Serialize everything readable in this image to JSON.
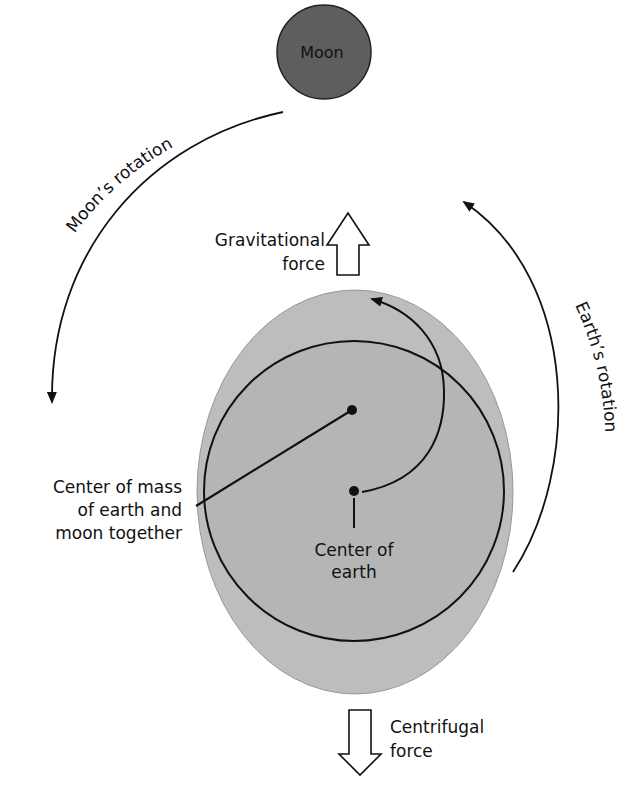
{
  "diagram": {
    "moon": {
      "label": "Moon",
      "fill": "#5e5e5e"
    },
    "earth": {
      "outer_fill": "#bdbdbd",
      "inner_fill": "#b3b3b3"
    },
    "labels": {
      "moon_rotation": "Moon’s rotation",
      "earth_rotation": "Earth’s rotation",
      "gravitational_line1": "Gravitational",
      "gravitational_line2": "force",
      "centrifugal_line1": "Centrifugal",
      "centrifugal_line2": "force",
      "center_mass_line1": "Center of mass",
      "center_mass_line2": "of earth and",
      "center_mass_line3": "moon together",
      "center_earth_line1": "Center of",
      "center_earth_line2": "earth"
    }
  }
}
